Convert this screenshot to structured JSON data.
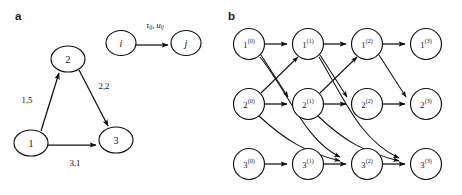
{
  "figure": {
    "panels": [
      {
        "id": "a",
        "letter": "a"
      },
      {
        "id": "b",
        "letter": "b"
      }
    ]
  },
  "panel_a": {
    "nodes": [
      {
        "id": "n1",
        "label": "1",
        "cx": 31,
        "cy": 143,
        "rx": 17,
        "ry": 13
      },
      {
        "id": "n2",
        "label": "2",
        "cx": 68,
        "cy": 59,
        "rx": 17,
        "ry": 13
      },
      {
        "id": "n3",
        "label": "3",
        "cx": 116,
        "cy": 140,
        "rx": 17,
        "ry": 13
      }
    ],
    "edges": [
      {
        "id": "e12",
        "from": "1",
        "to": "2",
        "label": "1,5",
        "label_x": 27,
        "label_y": 100
      },
      {
        "id": "e23",
        "from": "2",
        "to": "3",
        "label": "2,2",
        "label_x": 104,
        "label_y": 86
      },
      {
        "id": "e13",
        "from": "1",
        "to": "3",
        "label": "3,1",
        "label_x": 75,
        "label_y": 163
      }
    ],
    "legend": {
      "from_label": "i",
      "to_label": "j",
      "arc_label_tau": "τ",
      "arc_label_tau_sub": "ij",
      "arc_label_sep": ", ",
      "arc_label_u": "u",
      "arc_label_u_sub": "ij",
      "from_cx": 121,
      "from_cy": 43,
      "to_cx": 186,
      "to_cy": 43
    }
  },
  "panel_b": {
    "row_ids": [
      "1",
      "2",
      "3"
    ],
    "time_steps": [
      "(0)",
      "(1)",
      "(2)",
      "(3)"
    ],
    "node_radius": 15.5,
    "nodes": [
      {
        "id": "n1t0",
        "base": "1",
        "sup": "(0)",
        "cx": 249,
        "cy": 44
      },
      {
        "id": "n1t1",
        "base": "1",
        "sup": "(1)",
        "cx": 308,
        "cy": 44
      },
      {
        "id": "n1t2",
        "base": "1",
        "sup": "(2)",
        "cx": 367,
        "cy": 44
      },
      {
        "id": "n1t3",
        "base": "1",
        "sup": "(3)",
        "cx": 426,
        "cy": 44
      },
      {
        "id": "n2t0",
        "base": "2",
        "sup": "(0)",
        "cx": 249,
        "cy": 104
      },
      {
        "id": "n2t1",
        "base": "2",
        "sup": "(1)",
        "cx": 308,
        "cy": 104
      },
      {
        "id": "n2t2",
        "base": "2",
        "sup": "(2)",
        "cx": 367,
        "cy": 104
      },
      {
        "id": "n2t3",
        "base": "2",
        "sup": "(3)",
        "cx": 426,
        "cy": 104
      },
      {
        "id": "n3t0",
        "base": "3",
        "sup": "(0)",
        "cx": 249,
        "cy": 164
      },
      {
        "id": "n3t1",
        "base": "3",
        "sup": "(1)",
        "cx": 308,
        "cy": 164
      },
      {
        "id": "n3t2",
        "base": "3",
        "sup": "(2)",
        "cx": 367,
        "cy": 164
      },
      {
        "id": "n3t3",
        "base": "3",
        "sup": "(3)",
        "cx": 426,
        "cy": 164
      }
    ],
    "holdover_edges": [
      {
        "from": "n1t0",
        "to": "n1t1"
      },
      {
        "from": "n1t1",
        "to": "n1t2"
      },
      {
        "from": "n1t2",
        "to": "n1t3"
      },
      {
        "from": "n2t0",
        "to": "n2t1"
      },
      {
        "from": "n2t1",
        "to": "n2t2"
      },
      {
        "from": "n2t2",
        "to": "n2t3"
      },
      {
        "from": "n3t0",
        "to": "n3t1"
      },
      {
        "from": "n3t1",
        "to": "n3t2"
      },
      {
        "from": "n3t2",
        "to": "n3t3"
      }
    ],
    "transit_edges": [
      {
        "from": "n1t0",
        "to": "n2t1"
      },
      {
        "from": "n1t1",
        "to": "n2t2"
      },
      {
        "from": "n1t2",
        "to": "n2t3"
      },
      {
        "from": "n2t0",
        "to": "n1t1"
      },
      {
        "from": "n2t1",
        "to": "n1t2"
      },
      {
        "from": "n1t0",
        "to": "n3t2"
      },
      {
        "from": "n2t0",
        "to": "n3t2"
      },
      {
        "from": "n1t1",
        "to": "n3t3"
      },
      {
        "from": "n2t1",
        "to": "n3t3"
      }
    ]
  },
  "colors": {
    "stroke": "#101010",
    "background": "#ffffff",
    "text": "#111111"
  }
}
